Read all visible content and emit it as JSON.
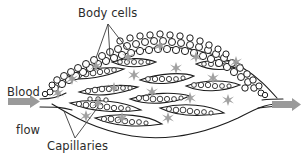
{
  "figure": {
    "labels": {
      "body_cells": "Body cells",
      "capillaries": "Capillaries",
      "blood_flow_line1": "Blood",
      "blood_flow_line2": "flow"
    },
    "icons": {
      "inflow_arrow": "right-arrow-icon",
      "outflow_arrow": "right-arrow-icon",
      "diffusion_marker": "star-marker-icon"
    },
    "colors": {
      "background": "#ffffff",
      "ink": "#1c1c1c",
      "text": "#2b2b2b",
      "arrow_gray": "#9a9a9a",
      "marker_gray": "#9d9d9d",
      "cell_fill": "#ffffff"
    }
  }
}
